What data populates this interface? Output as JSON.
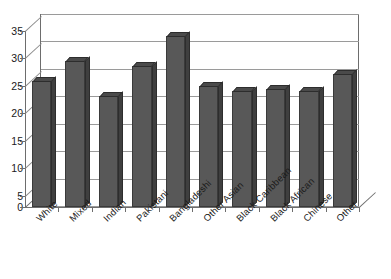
{
  "chart_data": {
    "type": "bar",
    "title": "",
    "subtitle": "",
    "xlabel": "",
    "ylabel": "",
    "ylim": [
      0,
      35
    ],
    "ytick_step": 5,
    "yticks": [
      "0",
      "5",
      "10",
      "15",
      "20",
      "25",
      "30",
      "35"
    ],
    "grid": true,
    "legend": "none",
    "style": "3d-column",
    "categories": [
      "White",
      "Mixed",
      "Indian",
      "Pakistani",
      "Bangladeshi",
      "Other Asian",
      "Black Caribbean",
      "Black African",
      "Chinese",
      "Other"
    ],
    "values": [
      25,
      29,
      22,
      28,
      34,
      24,
      23,
      23.5,
      23,
      26.5
    ],
    "annotations": []
  },
  "colors": {
    "bar_front": "#585858",
    "bar_side": "#3f3f3f",
    "bar_top": "#4a4a4a",
    "gridline": "#9a9a9a",
    "axis": "#6d6d6d",
    "plot_background": "#ffffff",
    "text": "#1a1a1a"
  }
}
